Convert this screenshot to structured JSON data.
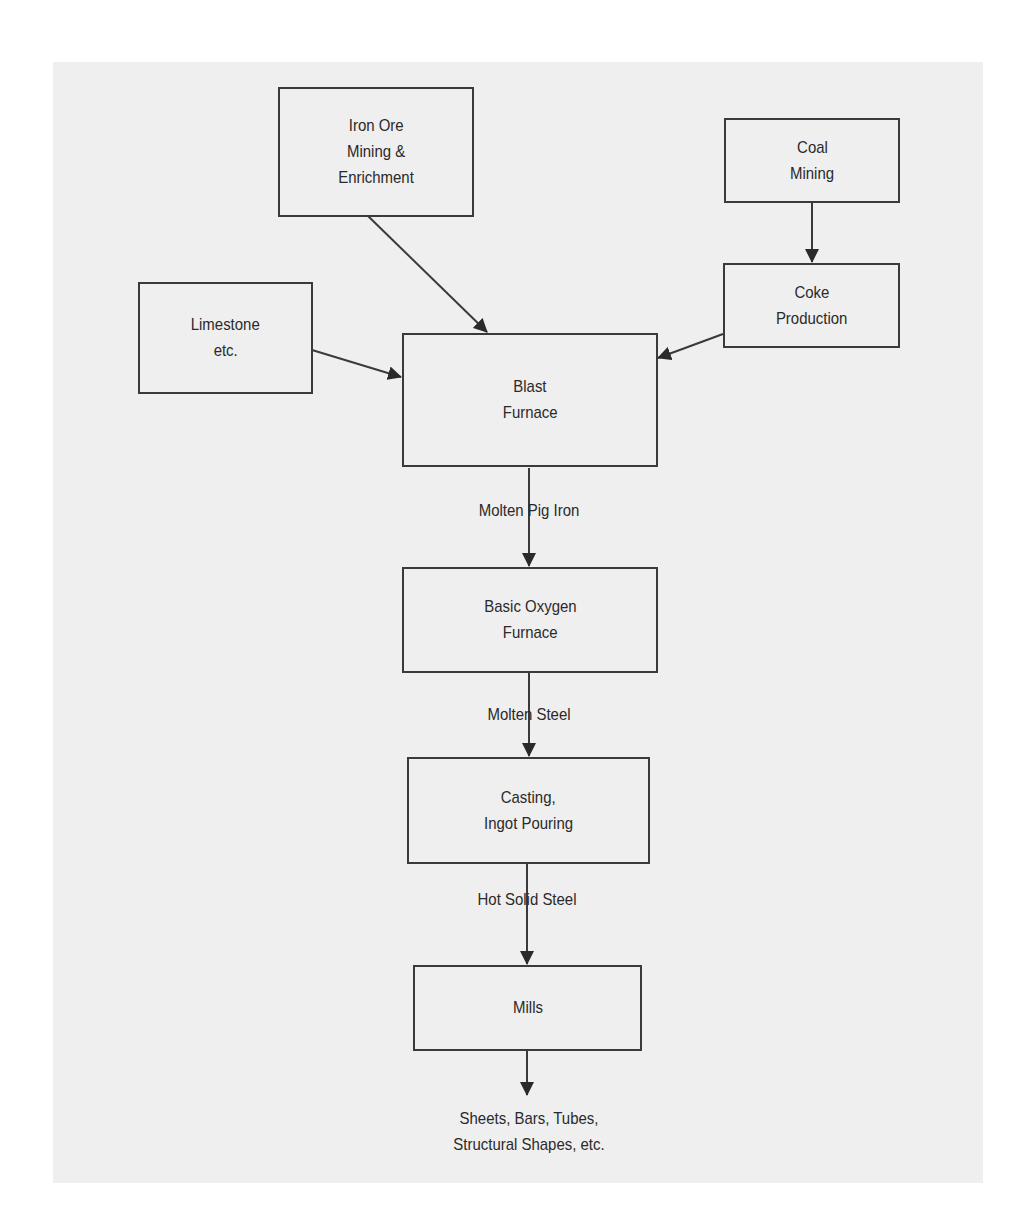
{
  "diagram": {
    "type": "flowchart",
    "title": "",
    "colors": {
      "panel_background": "#efefef",
      "page_background": "#ffffff",
      "stroke": "#3a3a3a",
      "text": "#2a2a2a"
    },
    "nodes": {
      "iron_ore": {
        "line1": "Iron Ore",
        "line2": "Mining &",
        "line3": "Enrichment"
      },
      "coal_mining": {
        "line1": "Coal",
        "line2": "Mining"
      },
      "limestone": {
        "line1": "Limestone",
        "line2": "etc."
      },
      "coke_production": {
        "line1": "Coke",
        "line2": "Production"
      },
      "blast_furnace": {
        "line1": "Blast",
        "line2": "Furnace"
      },
      "basic_oxygen_furnace": {
        "line1": "Basic Oxygen",
        "line2": "Furnace"
      },
      "casting": {
        "line1": "Casting,",
        "line2": "Ingot Pouring"
      },
      "mills": {
        "line1": "Mills"
      }
    },
    "edges": [
      {
        "from": "coal_mining",
        "to": "coke_production",
        "label": ""
      },
      {
        "from": "iron_ore",
        "to": "blast_furnace",
        "label": ""
      },
      {
        "from": "limestone",
        "to": "blast_furnace",
        "label": ""
      },
      {
        "from": "coke_production",
        "to": "blast_furnace",
        "label": ""
      },
      {
        "from": "blast_furnace",
        "to": "basic_oxygen_furnace",
        "label": "Molten Pig Iron"
      },
      {
        "from": "basic_oxygen_furnace",
        "to": "casting",
        "label": "Molten Steel"
      },
      {
        "from": "casting",
        "to": "mills",
        "label": "Hot Solid Steel"
      },
      {
        "from": "mills",
        "to": "output",
        "label": ""
      }
    ],
    "output": {
      "line1": "Sheets, Bars, Tubes,",
      "line2": "Structural Shapes, etc."
    }
  }
}
